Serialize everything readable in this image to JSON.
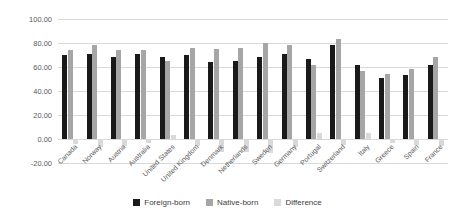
{
  "chart_data": {
    "type": "bar",
    "title": "",
    "xlabel": "",
    "ylabel": "",
    "categories": [
      "Canada",
      "Norway",
      "Austria",
      "Australia",
      "United States",
      "United Kingdom",
      "Denmark",
      "Netherlands",
      "Sweden",
      "Germany",
      "Portugal",
      "Switzerland",
      "Italy",
      "Greece",
      "Spain",
      "France"
    ],
    "series": [
      {
        "name": "Foreign-born",
        "color": "#1a1a1a",
        "values": [
          70,
          71,
          68,
          71,
          68,
          70,
          64,
          65,
          68,
          71,
          67,
          78,
          62,
          51,
          53,
          62
        ]
      },
      {
        "name": "Native-born",
        "color": "#a6a6a6",
        "values": [
          74,
          78,
          74,
          74,
          65,
          76,
          75,
          76,
          80,
          78,
          62,
          83,
          57,
          54,
          58,
          68
        ]
      },
      {
        "name": "Difference",
        "color": "#d9d9d9",
        "values": [
          -4,
          -7,
          -6,
          -3,
          3,
          -6,
          -11,
          -11,
          -12,
          -7,
          5,
          -5,
          5,
          -3,
          -5,
          -6
        ]
      }
    ],
    "ylim": [
      -20,
      100
    ],
    "y_tick_values": [
      100,
      80,
      60,
      40,
      20,
      0,
      -20
    ],
    "y_tick_labels": [
      "100.00",
      "80.00",
      "60.00",
      "40.00",
      "20.00",
      "0.00",
      "-20.00"
    ],
    "grid": true,
    "legend_position": "bottom"
  }
}
